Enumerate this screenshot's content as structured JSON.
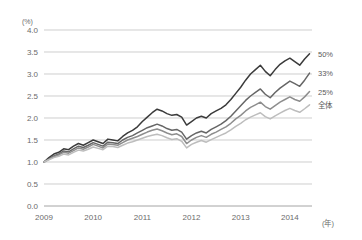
{
  "chart_data": {
    "type": "line",
    "title": "",
    "subtitle": "",
    "xlabel": "(年)",
    "ylabel": "(%)",
    "unit_label": "(%)",
    "xaxis_unit": "(年)",
    "grid": true,
    "legend_position": "right-end-of-line",
    "xlim": [
      2009.0,
      2014.45
    ],
    "ylim": [
      0.0,
      4.0
    ],
    "yticks": [
      "0.0",
      "0.5",
      "1.0",
      "1.5",
      "2.0",
      "2.5",
      "3.0",
      "3.5",
      "4.0"
    ],
    "ytick_values": [
      0.0,
      0.5,
      1.0,
      1.5,
      2.0,
      2.5,
      3.0,
      3.5,
      4.0
    ],
    "xticks": [
      "2009",
      "2010",
      "2011",
      "2012",
      "2013",
      "2014"
    ],
    "xtick_values": [
      2009,
      2010,
      2011,
      2012,
      2013,
      2014
    ],
    "x": [
      2009.0,
      2009.1,
      2009.2,
      2009.3,
      2009.4,
      2009.5,
      2009.6,
      2009.7,
      2009.8,
      2009.9,
      2010.0,
      2010.1,
      2010.2,
      2010.3,
      2010.4,
      2010.5,
      2010.6,
      2010.7,
      2010.8,
      2010.9,
      2011.0,
      2011.1,
      2011.2,
      2011.3,
      2011.4,
      2011.5,
      2011.6,
      2011.7,
      2011.8,
      2011.9,
      2012.0,
      2012.1,
      2012.2,
      2012.3,
      2012.4,
      2012.5,
      2012.6,
      2012.7,
      2012.8,
      2012.9,
      2013.0,
      2013.1,
      2013.2,
      2013.3,
      2013.4,
      2013.5,
      2013.6,
      2013.7,
      2013.8,
      2013.9,
      2014.0,
      2014.1,
      2014.2,
      2014.3,
      2014.4
    ],
    "series": [
      {
        "name": "50%",
        "label": "50%",
        "color": "#3b3b3b",
        "values": [
          1.0,
          1.1,
          1.18,
          1.22,
          1.3,
          1.28,
          1.36,
          1.42,
          1.38,
          1.44,
          1.5,
          1.46,
          1.42,
          1.52,
          1.5,
          1.48,
          1.58,
          1.66,
          1.72,
          1.8,
          1.92,
          2.02,
          2.12,
          2.2,
          2.16,
          2.1,
          2.06,
          2.08,
          2.02,
          1.84,
          1.92,
          2.0,
          2.04,
          2.0,
          2.1,
          2.16,
          2.22,
          2.3,
          2.42,
          2.56,
          2.7,
          2.86,
          3.0,
          3.1,
          3.2,
          3.06,
          2.96,
          3.1,
          3.22,
          3.3,
          3.36,
          3.28,
          3.2,
          3.34,
          3.46
        ]
      },
      {
        "name": "33%",
        "label": "33%",
        "color": "#666666",
        "values": [
          1.0,
          1.07,
          1.14,
          1.18,
          1.25,
          1.23,
          1.3,
          1.36,
          1.33,
          1.38,
          1.44,
          1.4,
          1.36,
          1.45,
          1.44,
          1.42,
          1.5,
          1.56,
          1.6,
          1.66,
          1.72,
          1.78,
          1.82,
          1.86,
          1.82,
          1.76,
          1.72,
          1.74,
          1.68,
          1.52,
          1.6,
          1.66,
          1.7,
          1.66,
          1.74,
          1.8,
          1.86,
          1.94,
          2.04,
          2.16,
          2.28,
          2.4,
          2.5,
          2.58,
          2.66,
          2.54,
          2.46,
          2.58,
          2.68,
          2.76,
          2.84,
          2.78,
          2.72,
          2.86,
          3.02
        ]
      },
      {
        "name": "25%",
        "label": "25%",
        "color": "#8e8e8e",
        "values": [
          1.0,
          1.06,
          1.12,
          1.16,
          1.22,
          1.2,
          1.26,
          1.32,
          1.29,
          1.34,
          1.4,
          1.36,
          1.32,
          1.41,
          1.4,
          1.38,
          1.44,
          1.5,
          1.54,
          1.58,
          1.63,
          1.68,
          1.72,
          1.75,
          1.71,
          1.66,
          1.62,
          1.64,
          1.58,
          1.42,
          1.5,
          1.56,
          1.6,
          1.56,
          1.63,
          1.68,
          1.74,
          1.8,
          1.88,
          1.98,
          2.06,
          2.16,
          2.24,
          2.3,
          2.36,
          2.26,
          2.2,
          2.28,
          2.36,
          2.42,
          2.48,
          2.42,
          2.38,
          2.48,
          2.6
        ]
      },
      {
        "name": "全体",
        "label": "全体",
        "color": "#bdbdbd",
        "values": [
          1.0,
          1.05,
          1.1,
          1.13,
          1.18,
          1.16,
          1.22,
          1.27,
          1.25,
          1.29,
          1.34,
          1.31,
          1.28,
          1.36,
          1.35,
          1.33,
          1.38,
          1.43,
          1.46,
          1.5,
          1.54,
          1.58,
          1.61,
          1.63,
          1.6,
          1.55,
          1.51,
          1.53,
          1.47,
          1.32,
          1.4,
          1.45,
          1.49,
          1.45,
          1.51,
          1.56,
          1.61,
          1.66,
          1.73,
          1.81,
          1.88,
          1.96,
          2.02,
          2.07,
          2.12,
          2.03,
          1.98,
          2.05,
          2.11,
          2.17,
          2.22,
          2.17,
          2.13,
          2.21,
          2.3
        ]
      }
    ]
  }
}
